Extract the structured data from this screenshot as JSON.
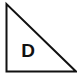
{
  "diagram": {
    "shape": "right-triangle",
    "label": "D",
    "stroke_color": "#111111",
    "fill_color": "#ffffff",
    "vertices": [
      [
        6,
        4
      ],
      [
        6,
        71
      ],
      [
        76,
        71
      ]
    ]
  }
}
